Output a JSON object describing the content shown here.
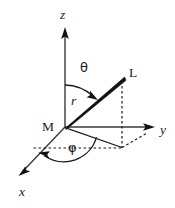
{
  "figure": {
    "background_color": "#ffffff",
    "line_color": "#1a1a1a",
    "ray_color": "#111111"
  },
  "axes": [
    {
      "id": "z",
      "label": "z",
      "direction": "up",
      "origin": {
        "x": 65,
        "y": 127
      },
      "tip": {
        "x": 65,
        "y": 30
      },
      "label_pos": {
        "x": 60,
        "y": 18
      }
    },
    {
      "id": "y",
      "label": "y",
      "direction": "right",
      "origin": {
        "x": 65,
        "y": 127
      },
      "tip": {
        "x": 154,
        "y": 127
      },
      "label_pos": {
        "x": 161,
        "y": 133
      }
    },
    {
      "id": "x",
      "label": "x",
      "direction": "down-left",
      "origin": {
        "x": 65,
        "y": 127
      },
      "tip": {
        "x": 19,
        "y": 175
      },
      "label_pos": {
        "x": 19,
        "y": 195
      }
    }
  ],
  "points": [
    {
      "id": "origin",
      "label": "M",
      "x": 65,
      "y": 127,
      "label_pos": {
        "x": 44,
        "y": 130
      }
    },
    {
      "id": "endpoint",
      "label": "L",
      "x": 124,
      "y": 78,
      "label_pos": {
        "x": 130,
        "y": 77
      }
    },
    {
      "id": "projection",
      "label": "",
      "x": 122,
      "y": 147
    }
  ],
  "quantities": [
    {
      "id": "radius",
      "label": "r",
      "label_pos": {
        "x": 72,
        "y": 105
      }
    },
    {
      "id": "polar-angle",
      "label": "θ",
      "label_pos": {
        "x": 81,
        "y": 72
      }
    },
    {
      "id": "azimuth-angle",
      "label": "φ",
      "label_pos": {
        "x": 69,
        "y": 151
      }
    }
  ],
  "ray": {
    "id": "radius-vector",
    "from": "M",
    "to": "L",
    "style": "solid-tapered-wedge"
  },
  "guides": [
    {
      "id": "vertical-drop",
      "style": "dotted",
      "from": {
        "x": 122,
        "y": 80
      },
      "to": {
        "x": 122,
        "y": 148
      }
    },
    {
      "id": "plane-horizontal",
      "style": "dashed",
      "from": {
        "x": 33,
        "y": 148
      },
      "to": {
        "x": 122,
        "y": 148
      }
    },
    {
      "id": "plane-diagonal",
      "style": "dashed",
      "from": {
        "x": 122,
        "y": 148
      },
      "to": {
        "x": 146,
        "y": 134
      }
    },
    {
      "id": "projection-radial",
      "style": "solid",
      "from": {
        "x": 65,
        "y": 127
      },
      "to": {
        "x": 122,
        "y": 147
      }
    }
  ],
  "arcs": [
    {
      "id": "theta-arc",
      "from_axis": "z",
      "to": "radius-vector",
      "arrowhead": "at-ray"
    },
    {
      "id": "phi-arc",
      "from_axis": "x",
      "to": "projection-radial",
      "arrowhead": "at-x-axis"
    }
  ]
}
